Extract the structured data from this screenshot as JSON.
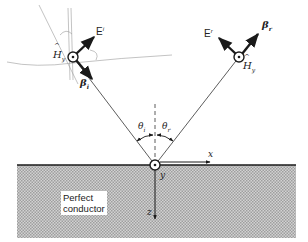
{
  "figure": {
    "medium_label_line1": "Perfect",
    "medium_label_line2": "conductor",
    "axes": {
      "x": "x",
      "y": "y",
      "z": "z"
    },
    "incident": {
      "E_label": "E",
      "E_sup": "i",
      "H_label": "H",
      "H_sub": "y",
      "beta_label": "β",
      "beta_sub": "i",
      "angle_label": "θ",
      "angle_sub": "i"
    },
    "reflected": {
      "E_label": "E",
      "E_sup": "r",
      "H_label": "H",
      "H_sub": "y",
      "beta_label": "β",
      "beta_sub": "r",
      "angle_label": "θ",
      "angle_sub": "r"
    },
    "colors": {
      "ink": "#1a1a1a",
      "conductor_fill": "#bdbdbd",
      "thin_line": "#555555",
      "sketch_line": "#9a9a9a",
      "background": "#ffffff"
    }
  }
}
